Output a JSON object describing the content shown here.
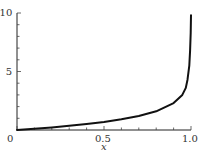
{
  "chart_data": {
    "type": "line",
    "title": "",
    "xlabel": "x",
    "ylabel": "",
    "xlim": [
      0,
      1.0
    ],
    "ylim": [
      0,
      10
    ],
    "xticks": [
      0,
      0.5,
      1.0
    ],
    "xtick_labels": [
      "0",
      "0.5",
      "1.0"
    ],
    "yticks": [
      5,
      10
    ],
    "ytick_labels": [
      "5",
      "10"
    ],
    "minor_xticks": [
      0.1,
      0.2,
      0.3,
      0.4,
      0.6,
      0.7,
      0.8,
      0.9
    ],
    "minor_yticks": [
      1,
      2,
      3,
      4,
      6,
      7,
      8,
      9
    ],
    "grid": false,
    "legend": null,
    "series": [
      {
        "name": "curve",
        "color": "#111111",
        "x": [
          0,
          0.1,
          0.2,
          0.3,
          0.4,
          0.5,
          0.6,
          0.7,
          0.8,
          0.9,
          0.95,
          0.97,
          0.98,
          0.99,
          0.995,
          0.998,
          1.0
        ],
        "y": [
          0,
          0.1,
          0.22,
          0.36,
          0.51,
          0.69,
          0.92,
          1.2,
          1.6,
          2.3,
          3.0,
          3.6,
          4.3,
          5.5,
          6.8,
          8.3,
          9.8
        ]
      }
    ]
  }
}
